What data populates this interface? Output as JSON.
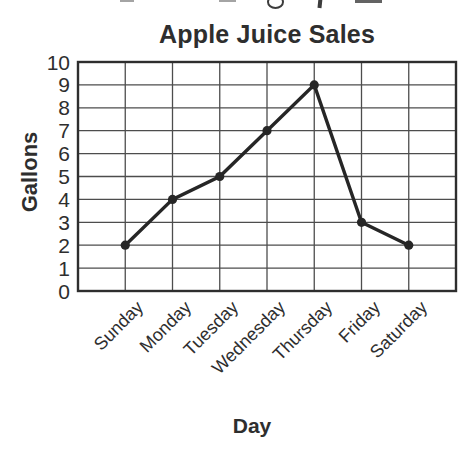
{
  "colors": {
    "ink": "#2e2e2e",
    "grid": "#4d4d4d",
    "series": "#262626",
    "background": "#ffffff"
  },
  "chart_data": {
    "type": "line",
    "title": "Apple Juice Sales",
    "xlabel": "Day",
    "ylabel": "Gallons",
    "categories": [
      "Sunday",
      "Monday",
      "Tuesday",
      "Wednesday",
      "Thursday",
      "Friday",
      "Saturday"
    ],
    "values": [
      2,
      4,
      5,
      7,
      9,
      3,
      2
    ],
    "ylim": [
      0,
      10
    ],
    "yticks": [
      0,
      1,
      2,
      3,
      4,
      5,
      6,
      7,
      8,
      9,
      10
    ],
    "grid": true,
    "legend_position": "none",
    "marker": "circle",
    "line_color": "#262626"
  }
}
